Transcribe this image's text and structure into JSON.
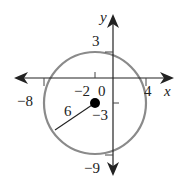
{
  "diagram": {
    "type": "circle-on-coordinate-plane",
    "axes": {
      "x_label": "x",
      "y_label": "y",
      "origin_label": "0"
    },
    "circle": {
      "center": [
        -2,
        -3
      ],
      "radius": 6,
      "radius_label": "6",
      "stroke_color": "#888888"
    },
    "tick_labels": {
      "top": "3",
      "bottom": "−9",
      "left": "−8",
      "right": "4",
      "center_x": "−2",
      "center_y": "−3"
    },
    "colors": {
      "axis": "#222222",
      "circle": "#888888",
      "center_point": "#000000"
    }
  }
}
